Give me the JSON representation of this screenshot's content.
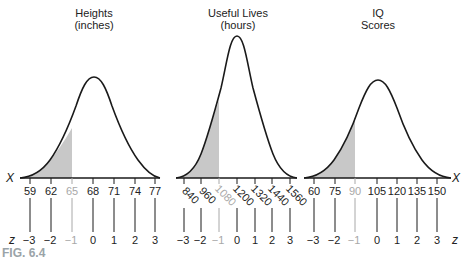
{
  "figure_label": "FIG. 6.4",
  "axis_letters": {
    "x": "X",
    "z": "z"
  },
  "colors": {
    "curve": "#1a1a1a",
    "shade": "#c8c8c8",
    "dim_label": "#a8a8a8",
    "fig_label": "#9aa3a8"
  },
  "panels": [
    {
      "title_line1": "Heights",
      "title_line2": "(inches)",
      "x_ticks": [
        "59",
        "62",
        "65",
        "68",
        "71",
        "74",
        "77"
      ],
      "z_ticks": [
        "−3",
        "−2",
        "−1",
        "0",
        "1",
        "2",
        "3"
      ],
      "shaded_below": "65"
    },
    {
      "title_line1": "Useful Lives",
      "title_line2": "(hours)",
      "x_ticks": [
        "840",
        "960",
        "1080",
        "1200",
        "1320",
        "1440",
        "1560"
      ],
      "z_ticks": [
        "−3",
        "−2",
        "−1",
        "0",
        "1",
        "2",
        "3"
      ],
      "shaded_below": "1080"
    },
    {
      "title_line1": "IQ",
      "title_line2": "Scores",
      "x_ticks": [
        "60",
        "75",
        "90",
        "105",
        "120",
        "135",
        "150"
      ],
      "z_ticks": [
        "−3",
        "−2",
        "−1",
        "0",
        "1",
        "2",
        "3"
      ],
      "shaded_below": "90"
    }
  ]
}
